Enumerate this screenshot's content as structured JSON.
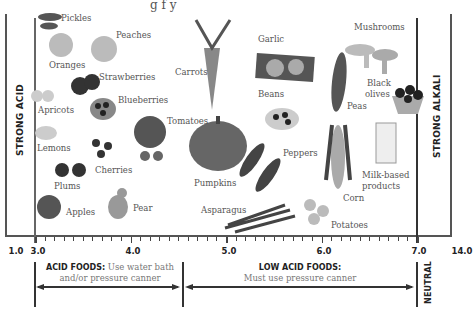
{
  "title_fragment": "g          f          y",
  "axis": {
    "ticks": [
      {
        "label": "1.0",
        "x": 16
      },
      {
        "label": "3.0",
        "x": 38
      },
      {
        "label": "4.0",
        "x": 133
      },
      {
        "label": "5.0",
        "x": 229
      },
      {
        "label": "6.0",
        "x": 324
      },
      {
        "label": "7.0",
        "x": 419
      },
      {
        "label": "14.0",
        "x": 462
      }
    ]
  },
  "side_labels": {
    "left": "STRONG ACID",
    "right": "STRONG ALKALI",
    "neutral": "NEUTRAL"
  },
  "categories": {
    "acid": {
      "title": "ACID FOODS:",
      "desc": "Use water bath",
      "desc2": "and/or pressure canner"
    },
    "low_acid": {
      "title": "LOW ACID FOODS:",
      "desc": "Must use pressure canner"
    }
  },
  "foods": [
    {
      "name": "Pickles",
      "x": 61,
      "y": 13
    },
    {
      "name": "Peaches",
      "x": 116,
      "y": 30
    },
    {
      "name": "Oranges",
      "x": 49,
      "y": 60
    },
    {
      "name": "Strawberries",
      "x": 99,
      "y": 72
    },
    {
      "name": "Apricots",
      "x": 38,
      "y": 105
    },
    {
      "name": "Blueberries",
      "x": 118,
      "y": 95
    },
    {
      "name": "Lemons",
      "x": 37,
      "y": 143
    },
    {
      "name": "Cherries",
      "x": 95,
      "y": 165
    },
    {
      "name": "Plums",
      "x": 54,
      "y": 181
    },
    {
      "name": "Apples",
      "x": 66,
      "y": 207
    },
    {
      "name": "Pear",
      "x": 133,
      "y": 203
    },
    {
      "name": "Tomatoes",
      "x": 167,
      "y": 116
    },
    {
      "name": "Carrots",
      "x": 175,
      "y": 67
    },
    {
      "name": "Pumpkins",
      "x": 194,
      "y": 178
    },
    {
      "name": "Asparagus",
      "x": 201,
      "y": 205
    },
    {
      "name": "Garlic",
      "x": 258,
      "y": 34
    },
    {
      "name": "Beans",
      "x": 258,
      "y": 89
    },
    {
      "name": "Peppers",
      "x": 283,
      "y": 148
    },
    {
      "name": "Peas",
      "x": 347,
      "y": 101
    },
    {
      "name": "Mushrooms",
      "x": 354,
      "y": 22
    },
    {
      "name": "Black",
      "x": 367,
      "y": 78
    },
    {
      "name": "olives",
      "x": 365,
      "y": 89
    },
    {
      "name": "Corn",
      "x": 343,
      "y": 193
    },
    {
      "name": "Milk-based",
      "x": 362,
      "y": 170
    },
    {
      "name": "products",
      "x": 362,
      "y": 181
    },
    {
      "name": "Potatoes",
      "x": 331,
      "y": 220
    }
  ],
  "colors": {
    "frame": "#555555",
    "text": "#444444",
    "dark": "#222222"
  }
}
